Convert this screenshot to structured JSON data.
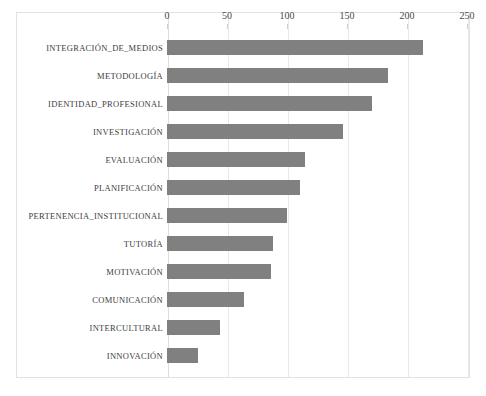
{
  "chart_data": {
    "type": "bar",
    "orientation": "horizontal",
    "title": "",
    "subtitle": "",
    "xlabel": "",
    "ylabel": "",
    "xlim": [
      0,
      250
    ],
    "ylim": null,
    "grid": true,
    "legend": null,
    "legend_position": "none",
    "xticks": [
      0,
      50,
      100,
      150,
      200,
      250
    ],
    "xtick_labels": [
      "0",
      "50",
      "100",
      "150",
      "200",
      "250"
    ],
    "categories": [
      "INTEGRACIÓN_DE_MEDIOS",
      "METODOLOGÍA",
      "IDENTIDAD_PROFESIONAL",
      "INVESTIGACIÓN",
      "EVALUACIÓN",
      "PLANIFICACIÓN",
      "PERTENENCIA_INSTITUCIONAL",
      "TUTORÍA",
      "MOTIVACIÓN",
      "COMUNICACIÓN",
      "INTERCULTURAL",
      "INNOVACIÓN"
    ],
    "values": [
      213,
      184,
      171,
      147,
      115,
      111,
      100,
      88,
      87,
      64,
      44,
      26
    ],
    "bar_color": "#808080",
    "grid_color": "#e8e8e8",
    "frame_color": "#e2e2e2",
    "text_color": "#3d3d3d"
  }
}
